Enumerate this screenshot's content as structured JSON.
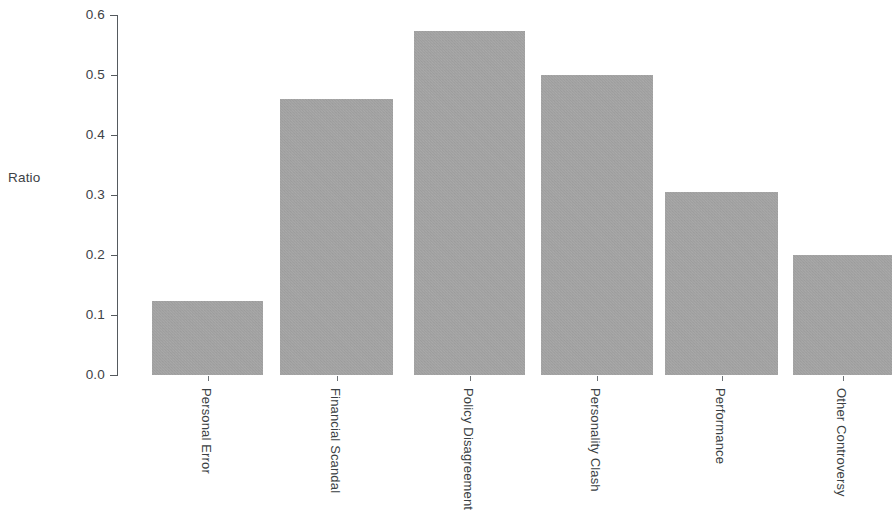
{
  "chart_data": {
    "type": "bar",
    "title": "",
    "subtitle": "",
    "xlabel": "",
    "ylabel": "Ratio",
    "categories": [
      "Personal Error",
      "Financial Scandal",
      "Policy Disagreement",
      "Personality Clash",
      "Performance",
      "Other Controversy"
    ],
    "values": [
      0.123,
      0.46,
      0.573,
      0.5,
      0.305,
      0.2
    ],
    "ylim": [
      0.0,
      0.6
    ],
    "y_ticks": [
      "0.0",
      "0.1",
      "0.2",
      "0.3",
      "0.4",
      "0.5",
      "0.6"
    ],
    "y_tick_values": [
      0.0,
      0.1,
      0.2,
      0.3,
      0.4,
      0.5,
      0.6
    ],
    "grid": false,
    "legend": false,
    "legend_position": "none",
    "bar_color": "#a9a9a9",
    "axis_color": "#555a5e",
    "text_color": "#3d4246",
    "background": "#ffffff"
  },
  "geometry": {
    "axis_x": 117,
    "baseline_y": 375,
    "top_y": 15,
    "px_per_unit": 600,
    "bars": [
      {
        "left": 152,
        "width": 111
      },
      {
        "left": 280,
        "width": 113
      },
      {
        "left": 414,
        "width": 111
      },
      {
        "left": 541,
        "width": 112
      },
      {
        "left": 665,
        "width": 113
      },
      {
        "left": 793,
        "width": 99
      }
    ]
  }
}
